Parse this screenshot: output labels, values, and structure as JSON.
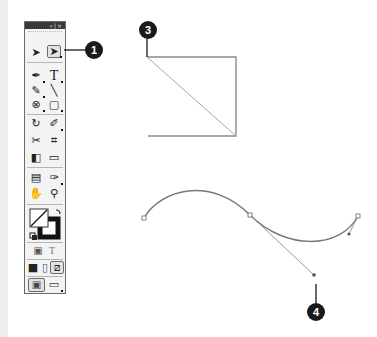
{
  "toolbox": {
    "title_controls": "»|×",
    "tools": [
      {
        "name": "selection-tool",
        "glyph": "➤"
      },
      {
        "name": "direct-selection-tool",
        "glyph": "➤",
        "selected": true
      },
      {
        "name": "pen-tool",
        "glyph": "✒"
      },
      {
        "name": "type-tool",
        "glyph": "T"
      },
      {
        "name": "pencil-tool",
        "glyph": "✎"
      },
      {
        "name": "line-tool",
        "glyph": "╲"
      },
      {
        "name": "blend-tool",
        "glyph": "⊗"
      },
      {
        "name": "rectangle-tool",
        "glyph": "▢"
      },
      {
        "name": "rotate-tool",
        "glyph": "↻"
      },
      {
        "name": "warp-tool",
        "glyph": "✐"
      },
      {
        "name": "scissors-tool",
        "glyph": "✂"
      },
      {
        "name": "mesh-tool",
        "glyph": "⌗"
      },
      {
        "name": "gradient-tool",
        "glyph": "◧"
      },
      {
        "name": "graph-tool",
        "glyph": "▭"
      },
      {
        "name": "notes-tool",
        "glyph": "▤"
      },
      {
        "name": "eyedropper-tool",
        "glyph": "✑"
      },
      {
        "name": "hand-tool",
        "glyph": "✋"
      },
      {
        "name": "zoom-tool",
        "glyph": "⚲"
      },
      {
        "name": "gradient-fill-button",
        "glyph": "▣"
      },
      {
        "name": "text-fill-button",
        "glyph": "T"
      },
      {
        "name": "color-mode-button",
        "glyph": "■"
      },
      {
        "name": "gradient-mode-button",
        "glyph": "▯"
      },
      {
        "name": "none-mode-button",
        "glyph": "⧄"
      },
      {
        "name": "normal-view-button",
        "glyph": "▣"
      },
      {
        "name": "preview-mode-button",
        "glyph": "▭"
      }
    ]
  },
  "callouts": [
    {
      "id": "1",
      "label": "1"
    },
    {
      "id": "3",
      "label": "3"
    },
    {
      "id": "4",
      "label": "4"
    }
  ],
  "colors": {
    "path_stroke": "#8a8a8a",
    "callout_bg": "#1a1a1a",
    "toolbox_bg": "#f3f3f3",
    "titlebar": "#3a3a3a"
  }
}
